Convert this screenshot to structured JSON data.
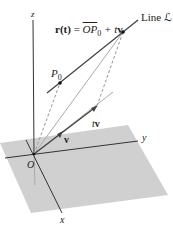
{
  "diagram": {
    "equation": {
      "lhs": "r(t)",
      "eq": " = ",
      "op": "OP",
      "sub": "0",
      "rest": " + t",
      "vec": "v"
    },
    "labels": {
      "line": "Line ℒ",
      "p0": "P",
      "p0_sub": "0",
      "tv_t": "t",
      "tv_v": "v",
      "v": "v",
      "origin": "O",
      "x_axis": "x",
      "y_axis": "y",
      "z_axis": "z"
    },
    "colors": {
      "plane": "#c8c8c8",
      "axis": "#333333",
      "line": "#444444",
      "light_line": "#aaaaaa",
      "dashed": "#999999"
    }
  }
}
